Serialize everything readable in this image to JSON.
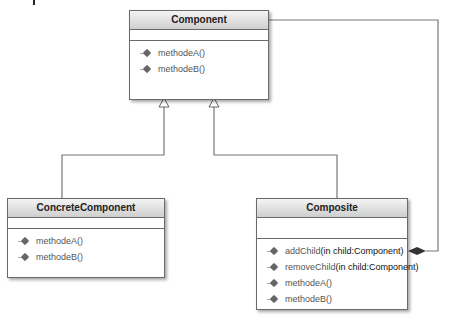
{
  "diagram": {
    "type": "UML class diagram",
    "classes": [
      {
        "name": "Component",
        "operations": [
          "methodeA()",
          "methodeB()"
        ]
      },
      {
        "name": "ConcreteComponent",
        "operations": [
          "methodeA()",
          "methodeB()"
        ]
      },
      {
        "name": "Composite",
        "operations": [
          {
            "name": "addChild",
            "params": "(in child:Component)"
          },
          {
            "name": "removeChild",
            "params": "(in child:Component)"
          },
          {
            "name": "methodeA()",
            "params": ""
          },
          {
            "name": "methodeB()",
            "params": ""
          }
        ]
      }
    ],
    "relations": [
      {
        "type": "generalization",
        "from": "ConcreteComponent",
        "to": "Component"
      },
      {
        "type": "generalization",
        "from": "Composite",
        "to": "Component"
      },
      {
        "type": "composition",
        "whole": "Composite",
        "part": "Component"
      }
    ]
  }
}
